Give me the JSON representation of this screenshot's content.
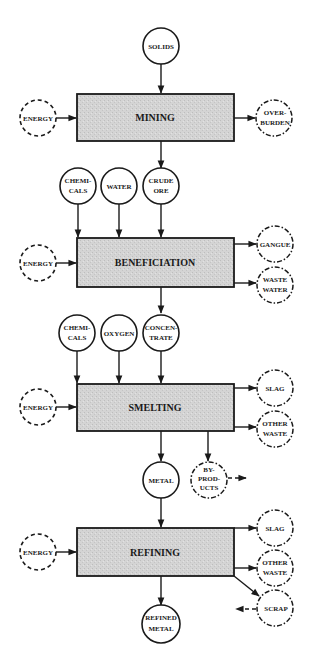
{
  "diagram": {
    "type": "process-flow",
    "colors": {
      "box_fill": "#d6d6d6",
      "stroke": "#1a1a1a",
      "background": "#ffffff"
    },
    "legend_notes": {
      "solid_circle": "material input/output",
      "dashed_circle": "energy input",
      "dashdot_circle": "waste / by-product output"
    },
    "stages": {
      "mining": {
        "label": "MINING",
        "inputs": [
          {
            "id": "solids",
            "lines": [
              "SOLIDS"
            ]
          }
        ],
        "energy": {
          "lines": [
            "ENERGY"
          ]
        },
        "outputs": [
          {
            "id": "overburden",
            "lines": [
              "OVER-",
              "BURDEN"
            ]
          }
        ]
      },
      "beneficiation": {
        "label": "BENEFICIATION",
        "inputs": [
          {
            "id": "chemicals",
            "lines": [
              "CHEMI-",
              "CALS"
            ]
          },
          {
            "id": "water",
            "lines": [
              "WATER"
            ]
          },
          {
            "id": "crude_ore",
            "lines": [
              "CRUDE",
              "ORE"
            ]
          }
        ],
        "energy": {
          "lines": [
            "ENERGY"
          ]
        },
        "outputs": [
          {
            "id": "gangue",
            "lines": [
              "GANGUE"
            ]
          },
          {
            "id": "waste_water",
            "lines": [
              "WASTE",
              "WATER"
            ]
          }
        ]
      },
      "smelting": {
        "label": "SMELTING",
        "inputs": [
          {
            "id": "chemicals",
            "lines": [
              "CHEMI-",
              "CALS"
            ]
          },
          {
            "id": "oxygen",
            "lines": [
              "OXYGEN"
            ]
          },
          {
            "id": "concentrate",
            "lines": [
              "CONCEN-",
              "TRATE"
            ]
          }
        ],
        "energy": {
          "lines": [
            "ENERGY"
          ]
        },
        "outputs": [
          {
            "id": "slag",
            "lines": [
              "SLAG"
            ]
          },
          {
            "id": "other_waste",
            "lines": [
              "OTHER",
              "WASTE"
            ]
          },
          {
            "id": "metal",
            "lines": [
              "METAL"
            ]
          },
          {
            "id": "by_products",
            "lines": [
              "BY-",
              "PROD-",
              "UCTS"
            ]
          }
        ]
      },
      "refining": {
        "label": "REFINING",
        "energy": {
          "lines": [
            "ENERGY"
          ]
        },
        "outputs": [
          {
            "id": "slag",
            "lines": [
              "SLAG"
            ]
          },
          {
            "id": "other_waste",
            "lines": [
              "OTHER",
              "WASTE"
            ]
          },
          {
            "id": "scrap",
            "lines": [
              "SCRAP"
            ]
          },
          {
            "id": "refined_metal",
            "lines": [
              "REFINED",
              "METAL"
            ]
          }
        ]
      }
    }
  }
}
